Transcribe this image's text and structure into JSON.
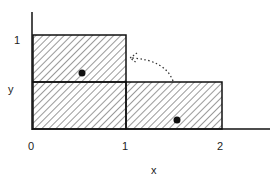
{
  "diagram": {
    "xlabel": "x",
    "ylabel": "y",
    "x_ticks": [
      "0",
      "1",
      "2"
    ],
    "y_ticks": [
      "1"
    ],
    "regions": [
      {
        "name": "upper-left-box",
        "x": [
          0,
          1
        ],
        "y": [
          0.5,
          1
        ],
        "hatched": true,
        "dot": true
      },
      {
        "name": "lower-left-box",
        "x": [
          0,
          1
        ],
        "y": [
          0,
          0.5
        ],
        "hatched": true,
        "dot": false
      },
      {
        "name": "lower-right-box",
        "x": [
          1,
          2
        ],
        "y": [
          0,
          0.5
        ],
        "hatched": true,
        "dot": true
      }
    ],
    "arrow": {
      "style": "dotted",
      "from": "lower-right-box",
      "to": "upper-left-box"
    },
    "colors": {
      "line": "#111111",
      "hatch": "#555555",
      "background": "#ffffff"
    }
  }
}
